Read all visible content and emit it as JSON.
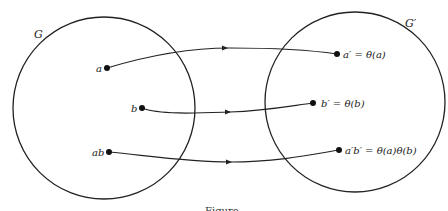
{
  "diagram": {
    "sets": [
      {
        "id": "G",
        "label": "G",
        "cx": 104,
        "cy": 108,
        "r": 91
      },
      {
        "id": "G_prime",
        "label": "G′",
        "cx": 355,
        "cy": 102,
        "r": 90
      }
    ],
    "domain_points": [
      {
        "label": "a",
        "x": 107,
        "y": 68
      },
      {
        "label": "b",
        "x": 142,
        "y": 108
      },
      {
        "label": "ab",
        "x": 109,
        "y": 152
      }
    ],
    "image_points": [
      {
        "label": "a′ = θ(a)",
        "x": 337,
        "y": 54
      },
      {
        "label": "b′ = θ(b)",
        "x": 313,
        "y": 103
      },
      {
        "label": "a′b′ = θ(a)θ(b)",
        "x": 339,
        "y": 150
      }
    ],
    "mappings": [
      {
        "from": "a",
        "to": "a′ = θ(a)"
      },
      {
        "from": "b",
        "to": "b′ = θ(b)"
      },
      {
        "from": "ab",
        "to": "a′b′ = θ(a)θ(b)"
      }
    ],
    "caption": "Figure"
  }
}
